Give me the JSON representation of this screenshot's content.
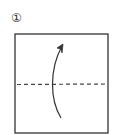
{
  "step": {
    "number_label": "①"
  },
  "diagram": {
    "shape": "square",
    "fold_line": "valley-fold-dashed-horizontal",
    "arrow": "fold-up-arrow",
    "colors": {
      "stroke": "#333333",
      "background": "#ffffff"
    }
  }
}
